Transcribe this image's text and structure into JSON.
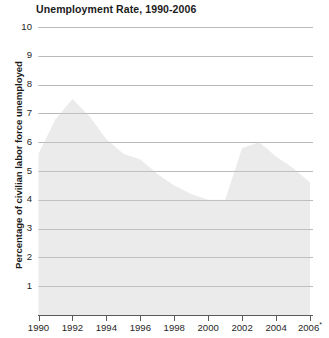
{
  "chart_data": {
    "type": "area",
    "title": "Unemployment Rate, 1990-2006",
    "xlabel": "",
    "ylabel": "Percentage of civilian labor force unemployed",
    "xlim": [
      1990,
      2006
    ],
    "ylim": [
      0,
      10
    ],
    "grid": true,
    "legend": "none",
    "fill_color": "#ebebeb",
    "grid_color": "#b9b9b9",
    "axis_color": "#5a5a5a",
    "text_color": "#1b1b1b",
    "x_tick_labels": [
      "1990",
      "1992",
      "1994",
      "1996",
      "1998",
      "2000",
      "2002",
      "2004",
      "2006*"
    ],
    "x_tick_values": [
      1990,
      1992,
      1994,
      1996,
      1998,
      2000,
      2002,
      2004,
      2006
    ],
    "y_tick_labels": [
      "10",
      "9",
      "8",
      "7",
      "6",
      "5",
      "4",
      "3",
      "2",
      "1"
    ],
    "y_tick_values": [
      10,
      9,
      8,
      7,
      6,
      5,
      4,
      3,
      2,
      1
    ],
    "annotations": [
      "2006 value marked with an asterisk"
    ],
    "x": [
      1990,
      1991,
      1992,
      1993,
      1994,
      1995,
      1996,
      1997,
      1998,
      1999,
      2000,
      2001,
      2002,
      2003,
      2004,
      2005,
      2006
    ],
    "values": [
      5.6,
      6.8,
      7.5,
      6.9,
      6.1,
      5.6,
      5.4,
      4.9,
      4.5,
      4.2,
      4.0,
      4.0,
      5.8,
      6.0,
      5.5,
      5.1,
      4.6
    ],
    "series": [
      {
        "name": "Percentage of civilian labor force unemployed",
        "values": [
          5.6,
          6.8,
          7.5,
          6.9,
          6.1,
          5.6,
          5.4,
          4.9,
          4.5,
          4.2,
          4.0,
          4.0,
          5.8,
          6.0,
          5.5,
          5.1,
          4.6
        ]
      }
    ]
  }
}
